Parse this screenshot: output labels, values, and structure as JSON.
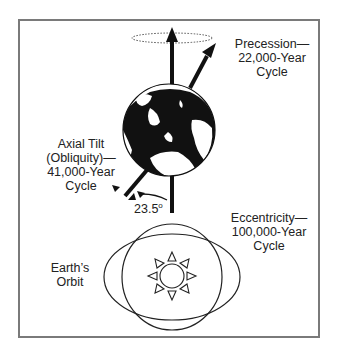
{
  "diagram": {
    "precession": {
      "lines": [
        "Precession—",
        "22,000-Year",
        "Cycle"
      ]
    },
    "axial_tilt": {
      "lines": [
        "Axial Tilt",
        "(Obliquity)—",
        "41,000-Year",
        "Cycle"
      ]
    },
    "tilt_angle": {
      "value": "23.5",
      "unit": "o"
    },
    "eccentricity": {
      "lines": [
        "Eccentricity—",
        "100,000-Year",
        "Cycle"
      ]
    },
    "orbit": {
      "lines": [
        "Earth’s",
        "Orbit"
      ]
    },
    "icons": {
      "earth": "earth-globe-icon",
      "sun": "sun-icon"
    },
    "colors": {
      "ink": "#111111",
      "text": "#222222",
      "frame": "#7a7a7a",
      "dotted": "#555555"
    }
  }
}
